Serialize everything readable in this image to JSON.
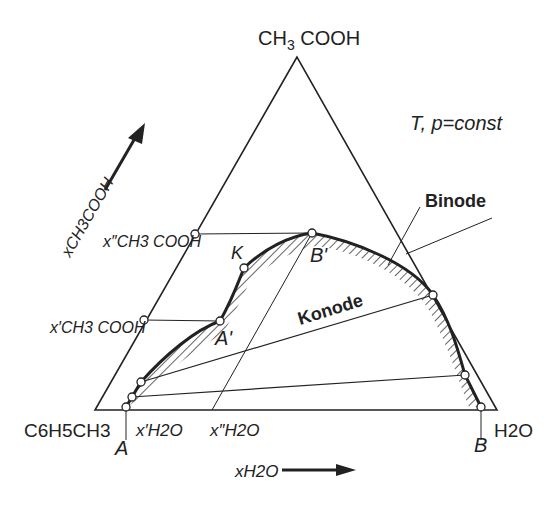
{
  "diagram": {
    "type": "ternary-phase-diagram",
    "condition": "T, p=const",
    "vertices": {
      "top": {
        "main": "CH",
        "sub": "3",
        "rest": " COOH"
      },
      "left": "C6H5CH3",
      "right": "H2O"
    },
    "axes": {
      "acetic_acid_axis": "xCH3COOH",
      "water_axis": "xH2O"
    },
    "labels": {
      "binode": "Binode",
      "konode": "Konode",
      "K": "K",
      "A_prime": "A'",
      "B_prime": "B'",
      "A": "A",
      "B": "B",
      "x2_acid": "x″CH3 COOH",
      "x1_acid": "x′CH3 COOH",
      "x1_water": "x′H2O",
      "x2_water": "x″H2O"
    },
    "colors": {
      "line": "#222222",
      "background": "#ffffff"
    }
  }
}
